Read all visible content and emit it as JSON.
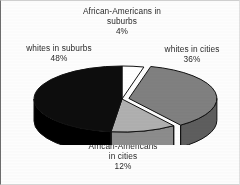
{
  "chart_data": {
    "type": "pie",
    "title": "",
    "subtitle": "",
    "xlabel": "",
    "ylabel": "",
    "legend_position": "none",
    "grid": false,
    "three_d": true,
    "exploded_slices": [
      "whites in cities"
    ],
    "start_angle_deg": 0,
    "direction": "clockwise",
    "categories": [
      "African-Americans in suburbs",
      "whites in cities",
      "African-Americans in cities",
      "whites in suburbs"
    ],
    "values": [
      4,
      36,
      12,
      48
    ],
    "value_unit": "%",
    "slices": [
      {
        "name": "African-Americans in suburbs",
        "value": 4,
        "percent_label": "4%",
        "label_lines": [
          "African-Americans in",
          "suburbs"
        ],
        "color": "#ffffff",
        "side_color": "#d9d9d9"
      },
      {
        "name": "whites in cities",
        "value": 36,
        "percent_label": "36%",
        "label_lines": [
          "whites in cities"
        ],
        "color": "#808080",
        "side_color": "#5e5e5e"
      },
      {
        "name": "African-Americans in cities",
        "value": 12,
        "percent_label": "12%",
        "label_lines": [
          "African-Americans",
          "in cities"
        ],
        "color": "#b0b0b0",
        "side_color": "#8c8c8c"
      },
      {
        "name": "whites in suburbs",
        "value": 48,
        "percent_label": "48%",
        "label_lines": [
          "whites in suburbs"
        ],
        "color": "#0d0d0d",
        "side_color": "#000000"
      }
    ]
  },
  "labels": {
    "aa_suburbs": {
      "line1": "African-Americans in",
      "line2": "suburbs",
      "pct": "4%"
    },
    "w_suburbs": {
      "line1": "whites in suburbs",
      "pct": "48%"
    },
    "w_cities": {
      "line1": "whites in cities",
      "pct": "36%"
    },
    "aa_cities": {
      "line1": "African-Americans",
      "line2": "in cities",
      "pct": "12%"
    }
  },
  "colors": {
    "whites_in_suburbs": "#0d0d0d",
    "whites_in_cities": "#808080",
    "aa_in_cities": "#b0b0b0",
    "aa_in_suburbs": "#ffffff",
    "outline": "#111111",
    "text": "#2a2a2a",
    "background": "#fdfdfd"
  }
}
